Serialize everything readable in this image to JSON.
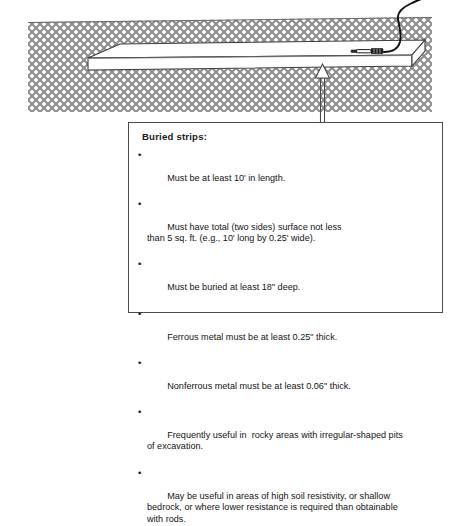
{
  "figure": {
    "title_semantic": "buried-strip-grounding-electrode-cross-section",
    "colors": {
      "soil_hatch": "#8e8e8e",
      "soil_background": "#ffffff",
      "strip_face": "#ffffff",
      "strip_outline": "#3d3d3d",
      "wire": "#111111",
      "clamp": "#1a1a1a",
      "leader_line": "#4a4a4a",
      "box_border": "#4a4a4a",
      "text": "#141414"
    }
  },
  "diagram": {
    "soil_label": "soil-cross-section-hatch",
    "ground_surface_label": "ground-surface-line",
    "strip_label": "buried-metal-strip",
    "wire_label": "grounding-conductor-wire",
    "clamp_label": "wire-to-strip-clamp",
    "arrow_label": "callout-leader-arrow"
  },
  "callout": {
    "title": "Buried strips:",
    "bullet_glyph": "•",
    "items": [
      "Must be at least 10' in length.",
      "Must have total (two sides) surface not less\nthan 5 sq. ft. (e.g., 10' long by 0.25' wide).",
      "Must be buried at least 18\" deep.",
      "Ferrous metal must be at least 0.25\" thick.",
      "Nonferrous metal must be at least 0.06\" thick.",
      "Frequently useful in  rocky areas with irregular-shaped pits\nof excavation.",
      "May be useful in areas of high soil resistivity, or shallow\nbedrock, or where lower resistance is required than obtainable\nwith rods."
    ]
  }
}
